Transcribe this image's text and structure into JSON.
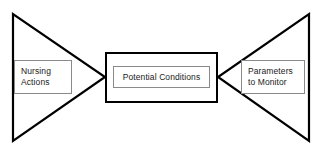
{
  "diagram": {
    "type": "clinical-reasoning-concept-map",
    "background_color": "#ffffff",
    "stroke_color": "#000000",
    "label_border_color": "#8a8a8a",
    "nodes": {
      "left": {
        "id": "nursing-actions",
        "shape": "triangle-pointing-right",
        "label_line1": "Nursing",
        "label_line2": "Actions"
      },
      "center": {
        "id": "potential-conditions",
        "shape": "rectangle",
        "label_line1": "Potential Conditions"
      },
      "right": {
        "id": "parameters-to-monitor",
        "shape": "triangle-pointing-left",
        "label_line1": "Parameters",
        "label_line2": "to Monitor"
      }
    }
  }
}
